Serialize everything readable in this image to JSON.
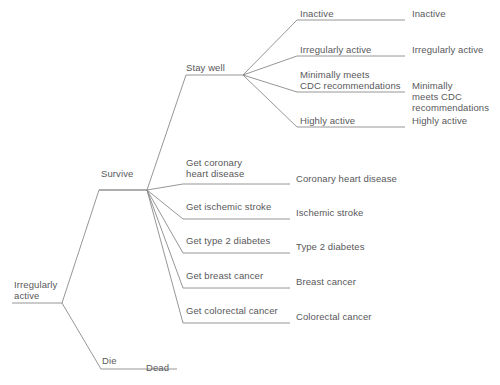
{
  "diagram": {
    "type": "decision-tree",
    "orientation": "left-to-right",
    "line_color": "#8a8a8c",
    "text_color": "#58585a",
    "background_color": "#ffffff"
  },
  "root": {
    "label": "Irregularly\nactive",
    "x": 14,
    "y": 279
  },
  "branches": {
    "survive": {
      "label": "Survive",
      "x": 101,
      "y": 168
    },
    "die": {
      "label": "Die",
      "x": 102,
      "y": 355
    },
    "dead_terminal": {
      "label": "Dead",
      "x": 146,
      "y": 362
    },
    "stay_well": {
      "label": "Stay well",
      "x": 186,
      "y": 62
    }
  },
  "activity_branches": [
    {
      "label": "Inactive",
      "label_x": 300,
      "label_y": 8,
      "terminal": "Inactive",
      "terminal_x": 412,
      "terminal_y": 8,
      "line_y": 20
    },
    {
      "label": "Irregularly active",
      "label_x": 300,
      "label_y": 44,
      "terminal": "Irregularly active",
      "terminal_x": 412,
      "terminal_y": 44,
      "line_y": 56
    },
    {
      "label": "Minimally meets\nCDC recommendations",
      "label_x": 300,
      "label_y": 69,
      "terminal": "Minimally\nmeets CDC\nrecommendations",
      "terminal_x": 412,
      "terminal_y": 80,
      "line_y": 92
    },
    {
      "label": "Highly active",
      "label_x": 300,
      "label_y": 115,
      "terminal": "Highly active",
      "terminal_x": 412,
      "terminal_y": 115,
      "line_y": 127
    }
  ],
  "disease_branches": [
    {
      "label": "Get coronary\nheart disease",
      "label_x": 186,
      "label_y": 157,
      "terminal": "Coronary heart disease",
      "terminal_x": 296,
      "terminal_y": 173,
      "line_y": 184
    },
    {
      "label": "Get ischemic stroke",
      "label_x": 186,
      "label_y": 201,
      "terminal": "Ischemic stroke",
      "terminal_x": 296,
      "terminal_y": 207,
      "line_y": 219
    },
    {
      "label": "Get type 2 diabetes",
      "label_x": 186,
      "label_y": 235,
      "terminal": "Type 2 diabetes",
      "terminal_x": 296,
      "terminal_y": 241,
      "line_y": 253
    },
    {
      "label": "Get breast cancer",
      "label_x": 186,
      "label_y": 270,
      "terminal": "Breast cancer",
      "terminal_x": 296,
      "terminal_y": 276,
      "line_y": 288
    },
    {
      "label": "Get colorectal cancer",
      "label_x": 186,
      "label_y": 305,
      "terminal": "Colorectal cancer",
      "terminal_x": 296,
      "terminal_y": 311,
      "line_y": 323
    }
  ]
}
